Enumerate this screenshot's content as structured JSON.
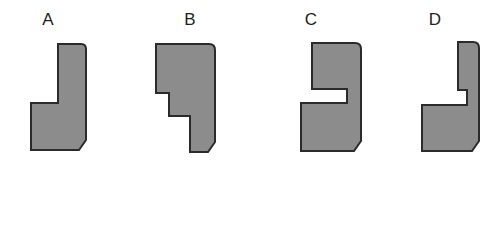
{
  "question": {
    "options": [
      {
        "label": "A",
        "label_x": 48,
        "label_y": 11,
        "shape_name": "shape-option-a",
        "shape_x": 27,
        "shape_y": 40,
        "shape_w": 62,
        "shape_h": 114,
        "viewbox": "0 0 62 114",
        "path": "M 31 4 L 54 4 Q 59 4 59 9 L 59 100 L 52 110 L 4 110 L 4 63 L 31 63 Z"
      },
      {
        "label": "B",
        "label_x": 190,
        "label_y": 11,
        "shape_name": "shape-option-b",
        "shape_x": 152,
        "shape_y": 38,
        "shape_w": 70,
        "shape_h": 118,
        "viewbox": "0 0 70 118",
        "path": "M 4 6 L 57 6 Q 63 6 63 12 L 63 104 L 56 114 L 38 114 L 38 78 L 17 78 L 17 55 L 4 55 Z"
      },
      {
        "label": "C",
        "label_x": 311,
        "label_y": 11,
        "shape_name": "shape-option-c",
        "shape_x": 293,
        "shape_y": 38,
        "shape_w": 76,
        "shape_h": 118,
        "viewbox": "0 0 76 118",
        "path": "M 19 5 L 62 5 Q 68 5 68 11 L 68 103 L 61 113 L 8 113 L 8 65 L 54 65 L 54 51 L 19 51 Z"
      },
      {
        "label": "D",
        "label_x": 435,
        "label_y": 11,
        "shape_name": "shape-option-d",
        "shape_x": 416,
        "shape_y": 37,
        "shape_w": 70,
        "shape_h": 119,
        "viewbox": "0 0 70 119",
        "path": "M 42 5 L 57 5 Q 63 5 63 11 L 63 104 L 56 114 L 6 114 L 6 68 L 51 68 L 51 53 L 42 53 Z"
      }
    ],
    "answer_label": "Answer",
    "answer_value": ""
  },
  "style": {
    "shape_fill": "#8c8c8c",
    "shape_stroke": "#2b2b2b",
    "text_color": "#231f20",
    "background": "#ffffff",
    "answer_box_border": "#4a4a4a"
  }
}
